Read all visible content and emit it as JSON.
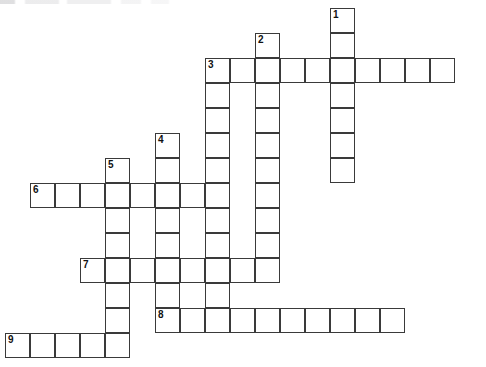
{
  "puzzle": {
    "title": "Crossword Puzzle Grid",
    "grid": {
      "cell_size_px": 25,
      "columns": 18,
      "rows": 14,
      "origin_x_px": 5,
      "origin_y_px": 8,
      "background_color": "#ffffff",
      "cell_border_color": "#3a3a3a",
      "number_color": "#111111"
    },
    "entries": [
      {
        "number": "1",
        "direction": "down",
        "length": 7,
        "start_col": 13,
        "start_row": 0
      },
      {
        "number": "2",
        "direction": "down",
        "length": 10,
        "start_col": 10,
        "start_row": 1
      },
      {
        "number": "3",
        "direction": "across",
        "length": 10,
        "start_col": 8,
        "start_row": 2
      },
      {
        "number": "3",
        "direction": "down",
        "length": 10,
        "start_col": 8,
        "start_row": 2
      },
      {
        "number": "4",
        "direction": "down",
        "length": 6,
        "start_col": 6,
        "start_row": 5
      },
      {
        "number": "5",
        "direction": "down",
        "length": 8,
        "start_col": 4,
        "start_row": 6
      },
      {
        "number": "6",
        "direction": "across",
        "length": 7,
        "start_col": 1,
        "start_row": 7
      },
      {
        "number": "7",
        "direction": "across",
        "length": 7,
        "start_col": 3,
        "start_row": 10
      },
      {
        "number": "8",
        "direction": "across",
        "length": 10,
        "start_col": 6,
        "start_row": 12
      },
      {
        "number": "9",
        "direction": "across",
        "length": 5,
        "start_col": 0,
        "start_row": 13
      }
    ],
    "cells": [
      {
        "col": 13,
        "row": 0,
        "number": "1",
        "letter": ""
      },
      {
        "col": 13,
        "row": 1,
        "number": "",
        "letter": ""
      },
      {
        "col": 10,
        "row": 1,
        "number": "2",
        "letter": ""
      },
      {
        "col": 8,
        "row": 2,
        "number": "3",
        "letter": ""
      },
      {
        "col": 9,
        "row": 2,
        "number": "",
        "letter": ""
      },
      {
        "col": 10,
        "row": 2,
        "number": "",
        "letter": ""
      },
      {
        "col": 11,
        "row": 2,
        "number": "",
        "letter": ""
      },
      {
        "col": 12,
        "row": 2,
        "number": "",
        "letter": ""
      },
      {
        "col": 13,
        "row": 2,
        "number": "",
        "letter": ""
      },
      {
        "col": 14,
        "row": 2,
        "number": "",
        "letter": ""
      },
      {
        "col": 15,
        "row": 2,
        "number": "",
        "letter": ""
      },
      {
        "col": 16,
        "row": 2,
        "number": "",
        "letter": ""
      },
      {
        "col": 17,
        "row": 2,
        "number": "",
        "letter": ""
      },
      {
        "col": 8,
        "row": 3,
        "number": "",
        "letter": ""
      },
      {
        "col": 10,
        "row": 3,
        "number": "",
        "letter": ""
      },
      {
        "col": 13,
        "row": 3,
        "number": "",
        "letter": ""
      },
      {
        "col": 8,
        "row": 4,
        "number": "",
        "letter": ""
      },
      {
        "col": 10,
        "row": 4,
        "number": "",
        "letter": ""
      },
      {
        "col": 13,
        "row": 4,
        "number": "",
        "letter": ""
      },
      {
        "col": 6,
        "row": 5,
        "number": "4",
        "letter": ""
      },
      {
        "col": 8,
        "row": 5,
        "number": "",
        "letter": ""
      },
      {
        "col": 10,
        "row": 5,
        "number": "",
        "letter": ""
      },
      {
        "col": 13,
        "row": 5,
        "number": "",
        "letter": ""
      },
      {
        "col": 6,
        "row": 6,
        "number": "",
        "letter": ""
      },
      {
        "col": 8,
        "row": 6,
        "number": "",
        "letter": ""
      },
      {
        "col": 10,
        "row": 6,
        "number": "",
        "letter": ""
      },
      {
        "col": 13,
        "row": 6,
        "number": "",
        "letter": ""
      },
      {
        "col": 4,
        "row": 6,
        "number": "5",
        "letter": ""
      },
      {
        "col": 1,
        "row": 7,
        "number": "6",
        "letter": ""
      },
      {
        "col": 2,
        "row": 7,
        "number": "",
        "letter": ""
      },
      {
        "col": 3,
        "row": 7,
        "number": "",
        "letter": ""
      },
      {
        "col": 4,
        "row": 7,
        "number": "",
        "letter": ""
      },
      {
        "col": 5,
        "row": 7,
        "number": "",
        "letter": ""
      },
      {
        "col": 6,
        "row": 7,
        "number": "",
        "letter": ""
      },
      {
        "col": 7,
        "row": 7,
        "number": "",
        "letter": ""
      },
      {
        "col": 8,
        "row": 7,
        "number": "",
        "letter": ""
      },
      {
        "col": 10,
        "row": 7,
        "number": "",
        "letter": ""
      },
      {
        "col": 4,
        "row": 8,
        "number": "",
        "letter": ""
      },
      {
        "col": 6,
        "row": 8,
        "number": "",
        "letter": ""
      },
      {
        "col": 8,
        "row": 8,
        "number": "",
        "letter": ""
      },
      {
        "col": 10,
        "row": 8,
        "number": "",
        "letter": ""
      },
      {
        "col": 4,
        "row": 9,
        "number": "",
        "letter": ""
      },
      {
        "col": 6,
        "row": 9,
        "number": "",
        "letter": ""
      },
      {
        "col": 8,
        "row": 9,
        "number": "",
        "letter": ""
      },
      {
        "col": 10,
        "row": 9,
        "number": "",
        "letter": ""
      },
      {
        "col": 3,
        "row": 10,
        "number": "7",
        "letter": ""
      },
      {
        "col": 4,
        "row": 10,
        "number": "",
        "letter": ""
      },
      {
        "col": 5,
        "row": 10,
        "number": "",
        "letter": ""
      },
      {
        "col": 6,
        "row": 10,
        "number": "",
        "letter": ""
      },
      {
        "col": 7,
        "row": 10,
        "number": "",
        "letter": ""
      },
      {
        "col": 8,
        "row": 10,
        "number": "",
        "letter": ""
      },
      {
        "col": 9,
        "row": 10,
        "number": "",
        "letter": ""
      },
      {
        "col": 10,
        "row": 10,
        "number": "",
        "letter": ""
      },
      {
        "col": 4,
        "row": 11,
        "number": "",
        "letter": ""
      },
      {
        "col": 6,
        "row": 11,
        "number": "",
        "letter": ""
      },
      {
        "col": 8,
        "row": 11,
        "number": "",
        "letter": ""
      },
      {
        "col": 4,
        "row": 12,
        "number": "",
        "letter": ""
      },
      {
        "col": 6,
        "row": 12,
        "number": "8",
        "letter": ""
      },
      {
        "col": 7,
        "row": 12,
        "number": "",
        "letter": ""
      },
      {
        "col": 8,
        "row": 12,
        "number": "",
        "letter": ""
      },
      {
        "col": 9,
        "row": 12,
        "number": "",
        "letter": ""
      },
      {
        "col": 10,
        "row": 12,
        "number": "",
        "letter": ""
      },
      {
        "col": 11,
        "row": 12,
        "number": "",
        "letter": ""
      },
      {
        "col": 12,
        "row": 12,
        "number": "",
        "letter": ""
      },
      {
        "col": 13,
        "row": 12,
        "number": "",
        "letter": ""
      },
      {
        "col": 14,
        "row": 12,
        "number": "",
        "letter": ""
      },
      {
        "col": 15,
        "row": 12,
        "number": "",
        "letter": ""
      },
      {
        "col": 0,
        "row": 13,
        "number": "9",
        "letter": ""
      },
      {
        "col": 1,
        "row": 13,
        "number": "",
        "letter": ""
      },
      {
        "col": 2,
        "row": 13,
        "number": "",
        "letter": ""
      },
      {
        "col": 3,
        "row": 13,
        "number": "",
        "letter": ""
      },
      {
        "col": 4,
        "row": 13,
        "number": "",
        "letter": ""
      }
    ]
  }
}
